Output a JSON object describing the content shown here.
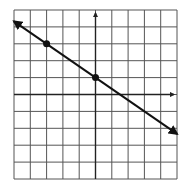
{
  "chart_data": {
    "type": "line",
    "title": "",
    "xlabel": "",
    "ylabel": "",
    "xlim": [
      -5,
      5
    ],
    "ylim": [
      -5,
      5
    ],
    "grid": true,
    "grid_step": 1,
    "axes_arrows": true,
    "series": [
      {
        "name": "line",
        "equation": "y = -2/3 x + 1",
        "slope": -0.6667,
        "intercept": 1,
        "x": [
          -5,
          5
        ],
        "y": [
          4.33,
          -2.33
        ],
        "arrows_both_ends": true
      }
    ],
    "points": [
      {
        "x": -3,
        "y": 3
      },
      {
        "x": 0,
        "y": 1
      }
    ]
  },
  "colors": {
    "grid": "#555555",
    "axis": "#222222",
    "line": "#111111",
    "background": "#ffffff"
  }
}
